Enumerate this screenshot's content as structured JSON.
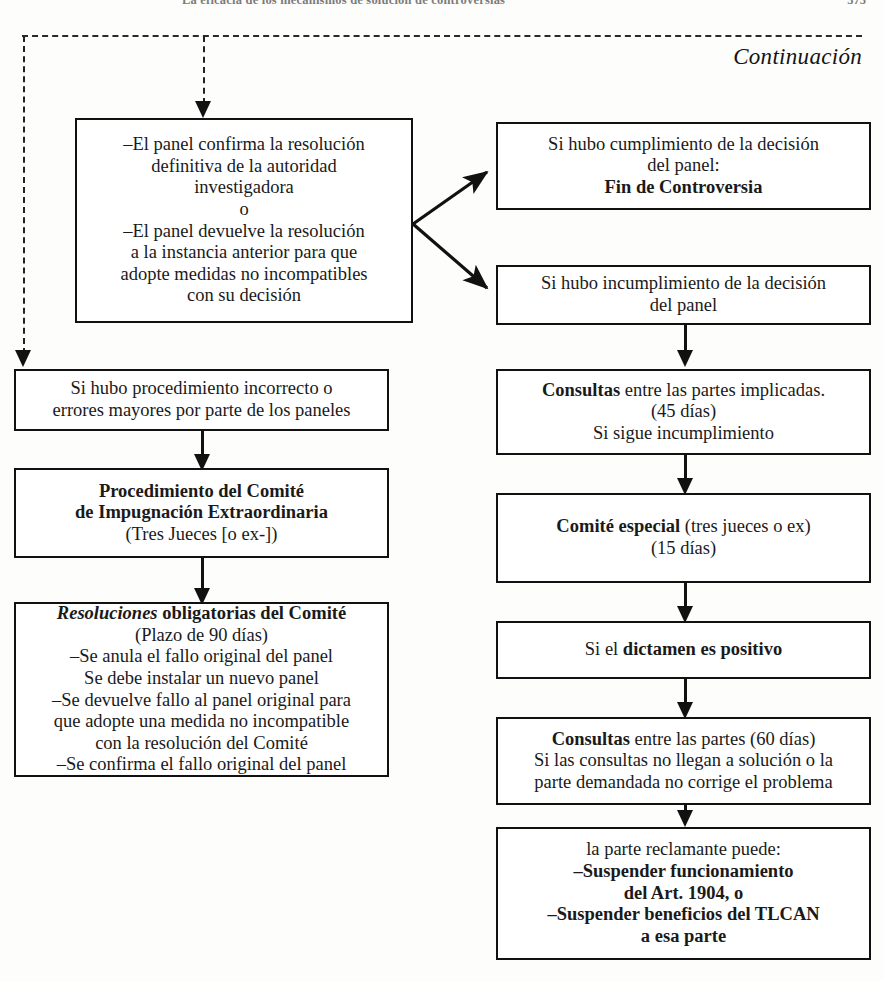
{
  "runhead": {
    "title": "La eficacia de los mecanismos de solución de controversias",
    "folio": "373"
  },
  "header": {
    "continuation_label": "Continuación"
  },
  "nodes": {
    "panel_confirma": {
      "id": "panel-confirma",
      "lines": [
        "–El panel confirma la resolución",
        "definitiva de la autoridad",
        "investigadora",
        "o",
        "–El panel devuelve la resolución",
        "a la instancia anterior para que",
        "adopte medidas no incompatibles",
        "con su decisión"
      ]
    },
    "fin_controversia": {
      "id": "fin-controversia",
      "lines": [
        "Si hubo cumplimiento de la decisión",
        "del panel:"
      ],
      "bold_line": "Fin de Controversia"
    },
    "incumplimiento": {
      "id": "incumplimiento",
      "lines": [
        "Si hubo incumplimiento de la decisión",
        "del panel"
      ]
    },
    "procedimiento_incorrecto": {
      "id": "procedimiento-incorrecto",
      "lines": [
        "Si hubo procedimiento incorrecto o",
        "errores mayores por parte de los paneles"
      ]
    },
    "consultas_45": {
      "id": "consultas-45",
      "bold_lead": "Consultas",
      "lead_rest": " entre las partes implicadas.",
      "lines": [
        "(45 días)",
        "Si sigue incumplimiento"
      ]
    },
    "comite_impugnacion": {
      "id": "comite-impugnacion",
      "bold_lines": [
        "Procedimiento del Comité",
        "de Impugnación Extraordinaria"
      ],
      "lines": [
        "(Tres Jueces [o ex-])"
      ]
    },
    "comite_especial": {
      "id": "comite-especial",
      "bold_lead": "Comité especial",
      "lead_rest": " (tres jueces o ex)",
      "lines": [
        "(15 días)"
      ]
    },
    "resoluciones": {
      "id": "resoluciones",
      "italic_lead": "Resoluciones",
      "lead_rest": " obligatorias del Comité",
      "lines": [
        "(Plazo de 90 días)",
        "–Se anula el fallo original del panel",
        "Se debe instalar un nuevo panel",
        "–Se devuelve fallo al panel original para",
        "que adopte una medida no incompatible",
        "con la resolución del Comité",
        "–Se confirma el fallo original del panel"
      ]
    },
    "dictamen_positivo": {
      "id": "dictamen-positivo",
      "prefix": "Si el ",
      "bold_tail": "dictamen es positivo"
    },
    "consultas_60": {
      "id": "consultas-60",
      "bold_lead": "Consultas",
      "lead_rest": " entre las partes (60 días)",
      "lines": [
        "Si las consultas no llegan a solución o la",
        "parte demandada no corrige el problema"
      ]
    },
    "suspension": {
      "id": "suspension",
      "lines": [
        "la parte reclamante puede:"
      ],
      "bold_lines": [
        "–Suspender funcionamiento",
        "del Art. 1904, o",
        "–Suspender beneficios del TLCAN",
        "a esa parte"
      ]
    }
  },
  "colors": {
    "ink": "#111111",
    "paper": "#fdfdfc"
  }
}
